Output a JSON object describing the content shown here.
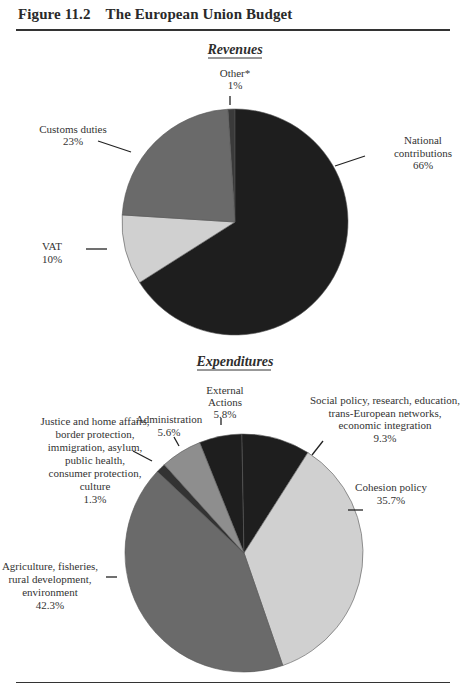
{
  "figure": {
    "title": "Figure 11.2 The European Union Budget"
  },
  "chart_data": [
    {
      "type": "pie",
      "title": "Revenues",
      "slices": [
        {
          "name": "Other*",
          "value": 1,
          "label_lines": [
            "Other*",
            "1%"
          ],
          "color": "#3a3a3a"
        },
        {
          "name": "National contributions",
          "value": 66,
          "label_lines": [
            "National",
            "contributions",
            "66%"
          ],
          "color": "#1e1e1e"
        },
        {
          "name": "VAT",
          "value": 10,
          "label_lines": [
            "VAT",
            "10%"
          ],
          "color": "#d0d0d0"
        },
        {
          "name": "Customs duties",
          "value": 23,
          "label_lines": [
            "Customs duties",
            "23%"
          ],
          "color": "#6a6a6a"
        }
      ],
      "unit": "%"
    },
    {
      "type": "pie",
      "title": "Expenditures",
      "slices": [
        {
          "name": "External Actions",
          "value": 5.8,
          "label_lines": [
            "External",
            "Actions",
            "5.8%"
          ],
          "color": "#1e1e1e"
        },
        {
          "name": "Social policy, research, education, trans-European networks, economic integration",
          "value": 9.3,
          "label_lines": [
            "Social policy, research, education,",
            "trans-European networks,",
            "economic integration",
            "9.3%"
          ],
          "color": "#1e1e1e"
        },
        {
          "name": "Cohesion policy",
          "value": 35.7,
          "label_lines": [
            "Cohesion policy",
            "35.7%"
          ],
          "color": "#d0d0d0"
        },
        {
          "name": "Agriculture, fisheries, rural development, environment",
          "value": 42.3,
          "label_lines": [
            "Agriculture, fisheries,",
            "rural development,",
            "environment",
            "42.3%"
          ],
          "color": "#6a6a6a"
        },
        {
          "name": "Justice and home affairs, border protection, immigration, asylum, public health, consumer protection, culture",
          "value": 1.3,
          "label_lines": [
            "Justice and home affairs,",
            "border protection,",
            "immigration, asylum,",
            "public health,",
            "consumer protection,",
            "culture",
            "1.3%"
          ],
          "color": "#333333"
        },
        {
          "name": "Administration",
          "value": 5.6,
          "label_lines": [
            "Administration",
            "5.6%"
          ],
          "color": "#8e8e8e"
        }
      ],
      "unit": "%"
    }
  ]
}
